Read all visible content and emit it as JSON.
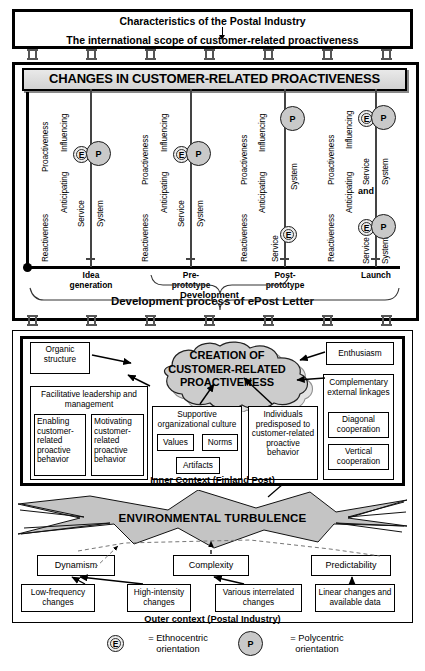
{
  "top_box": {
    "title": "Characteristics of the Postal Industry",
    "subtitle": "The international scope of customer-related proactiveness"
  },
  "middle_box": {
    "banner": "CHANGES IN CUSTOMER-RELATED PROACTIVENESS",
    "axis": {
      "upper_region": "Proactiveness",
      "lower_region": "Reactiveness",
      "upper_sub": "Influencing",
      "upper_sub2": "Anticipating",
      "dimension_service": "Service",
      "dimension_system": "System",
      "conjunction": "and"
    },
    "stages": [
      {
        "label_line1": "Idea",
        "label_line2": "generation"
      },
      {
        "label_line1": "Pre-",
        "label_line2": "prototype"
      },
      {
        "label_line1": "Post-",
        "label_line2": "prototype"
      },
      {
        "label_line1": "Launch",
        "label_line2": ""
      }
    ],
    "nodes": [
      {
        "stage": "Idea generation",
        "region": "Proactiveness",
        "marker": "E",
        "dimension": "Service"
      },
      {
        "stage": "Idea generation",
        "region": "Proactiveness",
        "marker": "P",
        "dimension": "System"
      },
      {
        "stage": "Pre-prototype",
        "region": "Proactiveness",
        "marker": "E",
        "dimension": "Service"
      },
      {
        "stage": "Pre-prototype",
        "region": "Proactiveness",
        "marker": "P",
        "dimension": "System"
      },
      {
        "stage": "Post-prototype",
        "region": "Proactiveness",
        "marker": "P",
        "dimension": "System"
      },
      {
        "stage": "Post-prototype",
        "region": "Reactiveness",
        "marker": "E",
        "dimension": "Service"
      },
      {
        "stage": "Launch",
        "region": "Proactiveness",
        "marker": "E",
        "dimension": "Service"
      },
      {
        "stage": "Launch",
        "region": "Proactiveness",
        "marker": "P",
        "dimension": "System"
      },
      {
        "stage": "Launch",
        "region": "Reactiveness",
        "marker": "E",
        "dimension": "Service"
      },
      {
        "stage": "Launch",
        "region": "Reactiveness",
        "marker": "P",
        "dimension": "System"
      }
    ],
    "brace_label": "Development",
    "process_label": "Development process of ePost Letter",
    "markers": {
      "E": "E",
      "P": "P"
    }
  },
  "inner_context": {
    "footer": "Inner Context (Finland Post)",
    "cloud": "CREATION OF CUSTOMER-RELATED PROACTIVENESS",
    "cloud_lines": [
      "CREATION OF",
      "CUSTOMER-RELATED",
      "PROACTIVENESS"
    ],
    "organic_structure": "Organic structure",
    "enthusiasm": "Enthusiasm",
    "facilitative": "Facilitative leadership and management",
    "enabling": "Enabling customer-related proactive behavior",
    "motivating": "Motivating customer-related proactive behavior",
    "supportive": "Supportive organizational culture",
    "values": "Values",
    "norms": "Norms",
    "artifacts": "Artifacts",
    "individuals": "Individuals predisposed to customer-related proactive behavior",
    "complementary": "Complementary external linkages",
    "diagonal": "Diagonal cooperation",
    "vertical": "Vertical cooperation"
  },
  "outer_context": {
    "footer": "Outer context (Postal Industry)",
    "turbulence": "ENVIRONMENTAL TURBULENCE",
    "factors": [
      {
        "name": "Dynamism",
        "drivers": [
          "Low-frequency changes",
          "High-intensity changes"
        ]
      },
      {
        "name": "Complexity",
        "drivers": [
          "Various interrelated changes"
        ]
      },
      {
        "name": "Predictability",
        "drivers": [
          "Linear changes and available data"
        ]
      }
    ],
    "dynamism": "Dynamism",
    "complexity": "Complexity",
    "predictability": "Predictability",
    "low_frequency": "Low-frequency changes",
    "high_intensity": "High-intensity changes",
    "various": "Various interrelated changes",
    "linear": "Linear changes and available data"
  },
  "legend": {
    "e_marker": "E",
    "e_text_line1": "= Ethnocentric",
    "e_text_line2": "orientation",
    "p_marker": "P",
    "p_text_line1": "= Polycentric",
    "p_text_line2": "orientation"
  },
  "colors": {
    "ink": "#000000",
    "node_e_fill": "#ebebeb",
    "node_p_fill": "#c9c9c9",
    "cloud_fill": "#cccccc",
    "turbulence_fill": "#c4c4c4",
    "banner_fill": "#e0e0e0"
  }
}
